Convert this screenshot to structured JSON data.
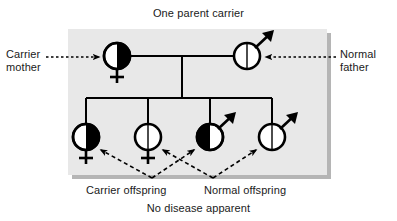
{
  "diagram": {
    "title": "One parent carrier",
    "footer": "No disease apparent",
    "panel_color": "#e8e8e8",
    "shadow_color": "#b5b5b5",
    "stroke_color": "#000000",
    "fill_affected_color": "#000000",
    "fill_normal_color": "#ffffff"
  },
  "annotations": {
    "carrier_mother": "Carrier\nmother",
    "carrier_mother_line1": "Carrier",
    "carrier_mother_line2": "mother",
    "normal_father_line1": "Normal",
    "normal_father_line2": "father",
    "carrier_offspring": "Carrier offspring",
    "normal_offspring": "Normal offspring"
  },
  "pedigree": {
    "generation_1": [
      {
        "id": "mother",
        "sex": "female",
        "sex_symbol": "venus",
        "status": "carrier",
        "shading": "half-filled-right",
        "label": "Carrier mother",
        "cx": 117,
        "cy": 56,
        "r": 13
      },
      {
        "id": "father",
        "sex": "male",
        "sex_symbol": "mars",
        "status": "normal",
        "shading": "unfilled",
        "label": "Normal father",
        "cx": 247,
        "cy": 56,
        "r": 13
      }
    ],
    "generation_2": [
      {
        "id": "child-1",
        "sex": "female",
        "sex_symbol": "venus",
        "status": "carrier",
        "shading": "half-filled-right",
        "label": "Carrier offspring",
        "cx": 86,
        "cy": 137,
        "r": 13
      },
      {
        "id": "child-2",
        "sex": "female",
        "sex_symbol": "venus",
        "status": "normal",
        "shading": "unfilled",
        "label": "Normal offspring",
        "cx": 148,
        "cy": 137,
        "r": 13
      },
      {
        "id": "child-3",
        "sex": "male",
        "sex_symbol": "mars",
        "status": "carrier",
        "shading": "half-filled-left",
        "label": "Carrier offspring",
        "cx": 210,
        "cy": 137,
        "r": 13
      },
      {
        "id": "child-4",
        "sex": "male",
        "sex_symbol": "mars",
        "status": "normal",
        "shading": "unfilled",
        "label": "Normal offspring",
        "cx": 272,
        "cy": 137,
        "r": 13
      }
    ],
    "ratio": {
      "carrier_count": 2,
      "normal_count": 2,
      "affected_count": 0
    }
  }
}
